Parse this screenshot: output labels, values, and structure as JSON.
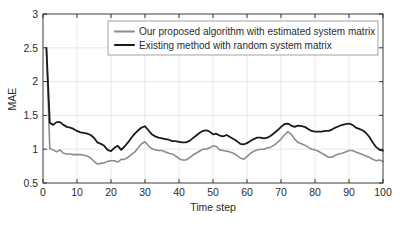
{
  "chart_data": {
    "type": "line",
    "title": "",
    "xlabel": "Time step",
    "ylabel": "MAE",
    "xlim": [
      0,
      100
    ],
    "ylim": [
      0.5,
      3
    ],
    "xticks": [
      0,
      10,
      20,
      30,
      40,
      50,
      60,
      70,
      80,
      90,
      100
    ],
    "yticks": [
      0.5,
      1,
      1.5,
      2,
      2.5,
      3
    ],
    "xticklabels": [
      "0",
      "10",
      "20",
      "30",
      "40",
      "50",
      "60",
      "70",
      "80",
      "90",
      "100"
    ],
    "yticklabels": [
      "0.5",
      "1",
      "1.5",
      "2",
      "2.5",
      "3"
    ],
    "grid": true,
    "legend_position": "top-center",
    "x": [
      1,
      2,
      3,
      4,
      5,
      6,
      7,
      8,
      9,
      10,
      11,
      12,
      13,
      14,
      15,
      16,
      17,
      18,
      19,
      20,
      21,
      22,
      23,
      24,
      25,
      26,
      27,
      28,
      29,
      30,
      31,
      32,
      33,
      34,
      35,
      36,
      37,
      38,
      39,
      40,
      41,
      42,
      43,
      44,
      45,
      46,
      47,
      48,
      49,
      50,
      51,
      52,
      53,
      54,
      55,
      56,
      57,
      58,
      59,
      60,
      61,
      62,
      63,
      64,
      65,
      66,
      67,
      68,
      69,
      70,
      71,
      72,
      73,
      74,
      75,
      76,
      77,
      78,
      79,
      80,
      81,
      82,
      83,
      84,
      85,
      86,
      87,
      88,
      89,
      90,
      91,
      92,
      93,
      94,
      95,
      96,
      97,
      98,
      99,
      100
    ],
    "series": [
      {
        "name": "Our proposed algorithm with estimated system matrix",
        "color": "#8c8c8c",
        "linewidth": 1.6,
        "values": [
          2.5,
          1.01,
          0.99,
          0.96,
          0.99,
          0.94,
          0.93,
          0.93,
          0.92,
          0.92,
          0.92,
          0.91,
          0.9,
          0.87,
          0.82,
          0.78,
          0.79,
          0.8,
          0.82,
          0.83,
          0.83,
          0.81,
          0.85,
          0.85,
          0.88,
          0.92,
          0.96,
          1.02,
          1.08,
          1.11,
          1.05,
          1.01,
          0.99,
          0.98,
          0.98,
          0.96,
          0.94,
          0.93,
          0.9,
          0.86,
          0.84,
          0.84,
          0.87,
          0.91,
          0.94,
          0.97,
          1.0,
          1.0,
          1.02,
          1.05,
          1.04,
          0.99,
          0.98,
          0.97,
          0.96,
          0.94,
          0.91,
          0.87,
          0.85,
          0.89,
          0.94,
          0.97,
          0.99,
          1.0,
          1.0,
          1.02,
          1.03,
          1.06,
          1.1,
          1.15,
          1.21,
          1.26,
          1.22,
          1.15,
          1.1,
          1.08,
          1.06,
          1.03,
          1.0,
          0.99,
          0.97,
          0.94,
          0.91,
          0.88,
          0.88,
          0.91,
          0.93,
          0.94,
          0.96,
          0.98,
          0.98,
          0.96,
          0.94,
          0.92,
          0.9,
          0.88,
          0.85,
          0.83,
          0.84,
          0.82
        ]
      },
      {
        "name": "Existing method with random system matrix",
        "color": "#1a1a1a",
        "linewidth": 1.8,
        "values": [
          2.5,
          1.39,
          1.36,
          1.4,
          1.4,
          1.36,
          1.33,
          1.32,
          1.3,
          1.27,
          1.25,
          1.24,
          1.23,
          1.21,
          1.17,
          1.1,
          1.08,
          1.05,
          0.99,
          0.97,
          1.02,
          1.05,
          0.99,
          1.04,
          1.1,
          1.17,
          1.23,
          1.28,
          1.32,
          1.34,
          1.28,
          1.22,
          1.19,
          1.17,
          1.16,
          1.15,
          1.14,
          1.12,
          1.12,
          1.11,
          1.1,
          1.1,
          1.12,
          1.16,
          1.2,
          1.24,
          1.27,
          1.28,
          1.26,
          1.22,
          1.23,
          1.2,
          1.19,
          1.21,
          1.18,
          1.15,
          1.12,
          1.08,
          1.07,
          1.09,
          1.12,
          1.15,
          1.17,
          1.17,
          1.16,
          1.17,
          1.2,
          1.24,
          1.28,
          1.33,
          1.37,
          1.38,
          1.35,
          1.33,
          1.35,
          1.34,
          1.33,
          1.3,
          1.27,
          1.26,
          1.26,
          1.26,
          1.27,
          1.27,
          1.29,
          1.32,
          1.34,
          1.36,
          1.37,
          1.38,
          1.36,
          1.32,
          1.3,
          1.28,
          1.24,
          1.18,
          1.1,
          1.03,
          0.99,
          0.98
        ]
      }
    ]
  },
  "legend": {
    "entries": [
      {
        "label": "Our proposed algorithm with estimated system matrix"
      },
      {
        "label": "Existing method with random system matrix"
      }
    ]
  }
}
